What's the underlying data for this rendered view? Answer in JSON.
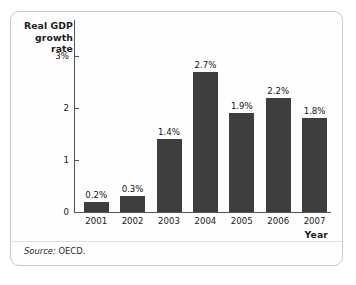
{
  "figure": {
    "source_prefix": "Source:",
    "source_value": "OECD.",
    "frame_color": "#c9c9c9",
    "background": "#ffffff"
  },
  "chart_data": {
    "type": "bar",
    "title": "",
    "subtitle": "",
    "ylabel": "Real GDP growth rate",
    "xlabel": "Year",
    "categories": [
      "2001",
      "2002",
      "2003",
      "2004",
      "2005",
      "2006",
      "2007"
    ],
    "values": [
      0.2,
      0.3,
      1.4,
      2.7,
      1.9,
      2.2,
      1.8
    ],
    "data_labels": [
      "0.2%",
      "0.3%",
      "1.4%",
      "2.7%",
      "1.9%",
      "2.2%",
      "1.8%"
    ],
    "ylim": [
      0,
      3.2
    ],
    "y_ticks": [
      0,
      1,
      2,
      3
    ],
    "y_tick_labels": [
      "0",
      "1",
      "2",
      "3%"
    ],
    "grid": false,
    "legend": false,
    "bar_color": "#3e3e3e",
    "axis_color": "#555555"
  }
}
